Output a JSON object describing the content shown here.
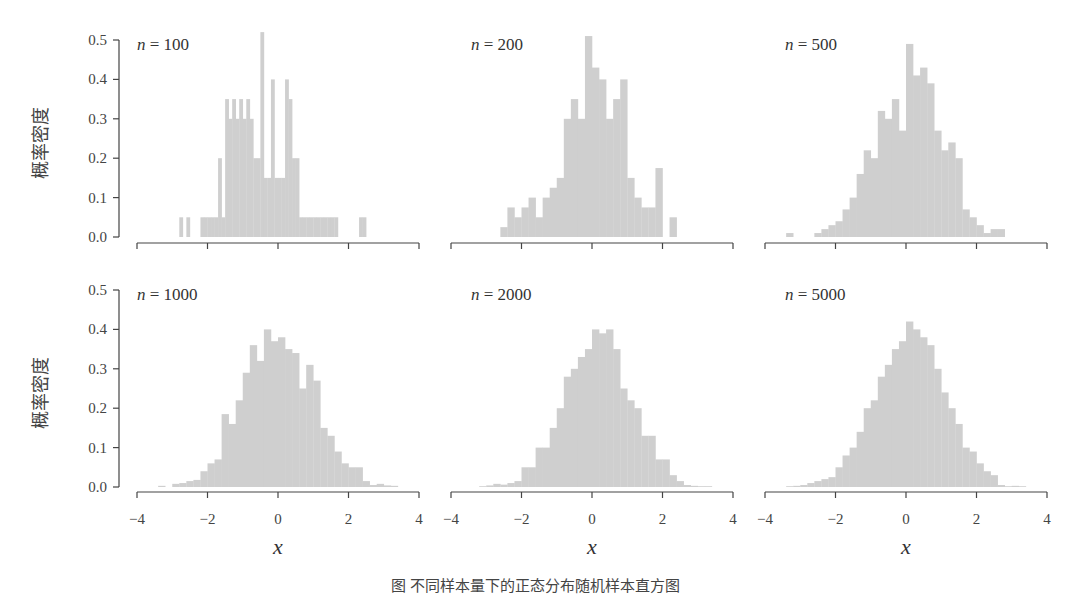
{
  "figure": {
    "bar_color": "#cfcfcf",
    "axis_color": "#444444",
    "ylabel": "概率密度",
    "xlabel": "x",
    "caption": "图 不同样本量下的正态分布随机样本直方图"
  },
  "chart_data": [
    {
      "type": "bar",
      "title": "n = 100",
      "n_label": "n",
      "n_value": "= 100",
      "xlabel": "",
      "ylabel": "概率密度",
      "xlim": [
        -4,
        4
      ],
      "ylim": [
        0,
        0.5
      ],
      "xticks": [
        -4,
        -2,
        0,
        2,
        4
      ],
      "show_xtick_labels": false,
      "yticks": [
        "0.0",
        "0.1",
        "0.2",
        "0.3",
        "0.4",
        "0.5"
      ],
      "show_yaxis": true,
      "bin_width": 0.1,
      "bins_start": [
        -2.8,
        -2.6,
        -2.2,
        -2.1,
        -2.0,
        -1.9,
        -1.8,
        -1.7,
        -1.6,
        -1.5,
        -1.4,
        -1.3,
        -1.2,
        -1.1,
        -1.0,
        -0.9,
        -0.8,
        -0.7,
        -0.6,
        -0.5,
        -0.4,
        -0.3,
        -0.2,
        -0.1,
        0.0,
        0.1,
        0.2,
        0.3,
        0.4,
        0.5,
        0.6,
        0.7,
        0.8,
        0.9,
        1.0,
        1.1,
        1.2,
        1.3,
        1.4,
        1.5,
        1.6,
        2.3,
        2.4
      ],
      "values": [
        0.05,
        0.05,
        0.05,
        0.05,
        0.05,
        0.05,
        0.05,
        0.2,
        0.05,
        0.35,
        0.3,
        0.35,
        0.3,
        0.35,
        0.3,
        0.35,
        0.3,
        0.2,
        0.2,
        0.52,
        0.15,
        0.15,
        0.4,
        0.15,
        0.15,
        0.15,
        0.4,
        0.35,
        0.2,
        0.2,
        0.05,
        0.05,
        0.05,
        0.05,
        0.05,
        0.05,
        0.05,
        0.05,
        0.05,
        0.05,
        0.05,
        0.05,
        0.05
      ]
    },
    {
      "type": "bar",
      "title": "n = 200",
      "n_label": "n",
      "n_value": "= 200",
      "xlim": [
        -4,
        4
      ],
      "ylim": [
        0,
        0.5
      ],
      "xticks": [
        -4,
        -2,
        0,
        2,
        4
      ],
      "show_xtick_labels": false,
      "show_yaxis": false,
      "bin_width": 0.2,
      "bins_start": [
        -2.6,
        -2.4,
        -2.2,
        -2.0,
        -1.8,
        -1.6,
        -1.4,
        -1.2,
        -1.0,
        -0.8,
        -0.6,
        -0.4,
        -0.2,
        0.0,
        0.2,
        0.4,
        0.6,
        0.8,
        1.0,
        1.2,
        1.4,
        1.6,
        1.8,
        2.0,
        2.2
      ],
      "values": [
        0.025,
        0.075,
        0.05,
        0.075,
        0.1,
        0.05,
        0.1,
        0.125,
        0.15,
        0.3,
        0.35,
        0.3,
        0.51,
        0.43,
        0.4,
        0.3,
        0.35,
        0.4,
        0.15,
        0.1,
        0.075,
        0.075,
        0.175,
        0.0,
        0.05
      ]
    },
    {
      "type": "bar",
      "title": "n = 500",
      "n_label": "n",
      "n_value": "= 500",
      "xlim": [
        -4,
        4
      ],
      "ylim": [
        0,
        0.5
      ],
      "xticks": [
        -4,
        -2,
        0,
        2,
        4
      ],
      "show_xtick_labels": false,
      "show_yaxis": false,
      "bin_width": 0.2,
      "bins_start": [
        -3.4,
        -2.6,
        -2.4,
        -2.2,
        -2.0,
        -1.8,
        -1.6,
        -1.4,
        -1.2,
        -1.0,
        -0.8,
        -0.6,
        -0.4,
        -0.2,
        0.0,
        0.2,
        0.4,
        0.6,
        0.8,
        1.0,
        1.2,
        1.4,
        1.6,
        1.8,
        2.0,
        2.2,
        2.4,
        2.6
      ],
      "values": [
        0.01,
        0.01,
        0.02,
        0.03,
        0.04,
        0.07,
        0.1,
        0.16,
        0.22,
        0.2,
        0.32,
        0.3,
        0.35,
        0.27,
        0.49,
        0.41,
        0.43,
        0.39,
        0.27,
        0.22,
        0.24,
        0.2,
        0.07,
        0.05,
        0.03,
        0.01,
        0.02,
        0.02
      ]
    },
    {
      "type": "bar",
      "title": "n = 1000",
      "n_label": "n",
      "n_value": "= 1000",
      "xlabel": "x",
      "ylabel": "概率密度",
      "xlim": [
        -4,
        4
      ],
      "ylim": [
        0,
        0.5
      ],
      "xticks": [
        -4,
        -2,
        0,
        2,
        4
      ],
      "show_xtick_labels": true,
      "yticks": [
        "0.0",
        "0.1",
        "0.2",
        "0.3",
        "0.4",
        "0.5"
      ],
      "show_yaxis": true,
      "bin_width": 0.2,
      "bins_start": [
        -3.4,
        -3.0,
        -2.8,
        -2.6,
        -2.4,
        -2.2,
        -2.0,
        -1.8,
        -1.6,
        -1.4,
        -1.2,
        -1.0,
        -0.8,
        -0.6,
        -0.4,
        -0.2,
        0.0,
        0.2,
        0.4,
        0.6,
        0.8,
        1.0,
        1.2,
        1.4,
        1.6,
        1.8,
        2.0,
        2.2,
        2.4,
        2.6,
        2.8,
        3.0,
        3.2
      ],
      "values": [
        0.003,
        0.008,
        0.01,
        0.015,
        0.018,
        0.04,
        0.06,
        0.07,
        0.185,
        0.16,
        0.22,
        0.29,
        0.36,
        0.32,
        0.4,
        0.37,
        0.38,
        0.35,
        0.34,
        0.25,
        0.31,
        0.27,
        0.15,
        0.13,
        0.09,
        0.06,
        0.05,
        0.05,
        0.015,
        0.005,
        0.008,
        0.004,
        0.003
      ]
    },
    {
      "type": "bar",
      "title": "n = 2000",
      "n_label": "n",
      "n_value": "= 2000",
      "xlabel": "x",
      "xlim": [
        -4,
        4
      ],
      "ylim": [
        0,
        0.5
      ],
      "xticks": [
        -4,
        -2,
        0,
        2,
        4
      ],
      "show_xtick_labels": true,
      "show_yaxis": false,
      "bin_width": 0.2,
      "bins_start": [
        -3.2,
        -3.0,
        -2.8,
        -2.6,
        -2.4,
        -2.2,
        -2.0,
        -1.8,
        -1.6,
        -1.4,
        -1.2,
        -1.0,
        -0.8,
        -0.6,
        -0.4,
        -0.2,
        0.0,
        0.2,
        0.4,
        0.6,
        0.8,
        1.0,
        1.2,
        1.4,
        1.6,
        1.8,
        2.0,
        2.2,
        2.4,
        2.6,
        2.8,
        3.0,
        3.2
      ],
      "values": [
        0.002,
        0.004,
        0.008,
        0.006,
        0.01,
        0.015,
        0.05,
        0.05,
        0.1,
        0.1,
        0.15,
        0.2,
        0.28,
        0.3,
        0.33,
        0.35,
        0.4,
        0.39,
        0.4,
        0.35,
        0.25,
        0.22,
        0.2,
        0.13,
        0.13,
        0.07,
        0.07,
        0.03,
        0.015,
        0.005,
        0.003,
        0.002,
        0.002
      ]
    },
    {
      "type": "bar",
      "title": "n = 5000",
      "n_label": "n",
      "n_value": "= 5000",
      "xlabel": "x",
      "xlim": [
        -4,
        4
      ],
      "ylim": [
        0,
        0.5
      ],
      "xticks": [
        -4,
        -2,
        0,
        2,
        4
      ],
      "show_xtick_labels": true,
      "show_yaxis": false,
      "bin_width": 0.2,
      "bins_start": [
        -3.4,
        -3.2,
        -3.0,
        -2.8,
        -2.6,
        -2.4,
        -2.2,
        -2.0,
        -1.8,
        -1.6,
        -1.4,
        -1.2,
        -1.0,
        -0.8,
        -0.6,
        -0.4,
        -0.2,
        0.0,
        0.2,
        0.4,
        0.6,
        0.8,
        1.0,
        1.2,
        1.4,
        1.6,
        1.8,
        2.0,
        2.2,
        2.4,
        2.6,
        2.8,
        3.0,
        3.2
      ],
      "values": [
        0.002,
        0.003,
        0.005,
        0.01,
        0.015,
        0.02,
        0.025,
        0.05,
        0.08,
        0.1,
        0.14,
        0.2,
        0.22,
        0.28,
        0.31,
        0.35,
        0.37,
        0.42,
        0.4,
        0.38,
        0.36,
        0.3,
        0.24,
        0.2,
        0.16,
        0.1,
        0.09,
        0.06,
        0.04,
        0.03,
        0.005,
        0.002,
        0.003,
        0.002
      ]
    }
  ]
}
